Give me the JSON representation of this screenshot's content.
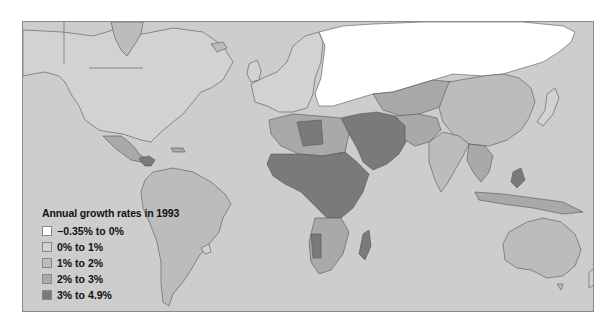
{
  "map": {
    "type": "choropleth",
    "subject": "World population annual growth rates",
    "year": "1993",
    "ocean_color": "#cdcdcd",
    "border_color": "#555555"
  },
  "legend": {
    "title": "Annual growth rates in 1993",
    "items": [
      {
        "label": "−0.35% to 0%",
        "color": "#ffffff"
      },
      {
        "label": "0% to 1%",
        "color": "#d2d2d2"
      },
      {
        "label": "1% to 2%",
        "color": "#bcbcbc"
      },
      {
        "label": "2% to 3%",
        "color": "#a9a9a9"
      },
      {
        "label": "3% to 4.9%",
        "color": "#7a7a7a"
      }
    ]
  },
  "regions": [
    {
      "name": "Canada",
      "category": "0% to 1%"
    },
    {
      "name": "United States",
      "category": "0% to 1%"
    },
    {
      "name": "Greenland",
      "category": "1% to 2%"
    },
    {
      "name": "Mexico",
      "category": "2% to 3%"
    },
    {
      "name": "Central America",
      "category": "3% to 4.9%"
    },
    {
      "name": "South America",
      "category": "1% to 2%"
    },
    {
      "name": "Uruguay",
      "category": "0% to 1%"
    },
    {
      "name": "Western Europe",
      "category": "0% to 1%"
    },
    {
      "name": "Eastern Europe",
      "category": "−0.35% to 0%"
    },
    {
      "name": "Russia",
      "category": "−0.35% to 0%"
    },
    {
      "name": "Central Asia",
      "category": "2% to 3%"
    },
    {
      "name": "China",
      "category": "1% to 2%"
    },
    {
      "name": "India",
      "category": "1% to 2%"
    },
    {
      "name": "Middle East",
      "category": "3% to 4.9%"
    },
    {
      "name": "North Africa",
      "category": "2% to 3%"
    },
    {
      "name": "Libya",
      "category": "3% to 4.9%"
    },
    {
      "name": "Sub-Saharan Africa",
      "category": "3% to 4.9%"
    },
    {
      "name": "Southern Africa",
      "category": "2% to 3%"
    },
    {
      "name": "Madagascar",
      "category": "3% to 4.9%"
    },
    {
      "name": "Southeast Asia",
      "category": "2% to 3%"
    },
    {
      "name": "Japan",
      "category": "0% to 1%"
    },
    {
      "name": "Australia",
      "category": "1% to 2%"
    }
  ]
}
